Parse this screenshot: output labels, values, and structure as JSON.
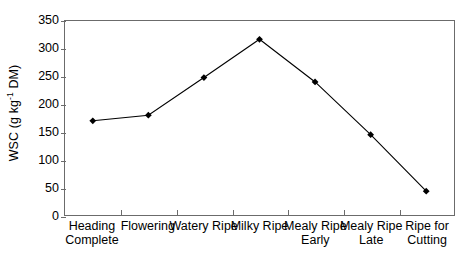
{
  "chart_data": {
    "type": "line",
    "title": "",
    "xlabel": "",
    "ylabel": "WSC (g kg⁻¹ DM)",
    "ylabel_parts": {
      "before": "WSC (g kg",
      "exponent": "-1",
      "after": " DM)"
    },
    "categories": [
      "Heading Complete",
      "Flowering",
      "Watery Ripe",
      "Milky Ripe",
      "Mealy Ripe Early",
      "Mealy Ripe Late",
      "Ripe for Cutting"
    ],
    "category_lines": [
      [
        "Heading",
        "Complete"
      ],
      [
        "Flowering"
      ],
      [
        "Watery Ripe"
      ],
      [
        "Milky Ripe"
      ],
      [
        "Mealy Ripe",
        "Early"
      ],
      [
        "Mealy Ripe",
        "Late"
      ],
      [
        "Ripe for",
        "Cutting"
      ]
    ],
    "values": [
      170,
      180,
      248,
      317,
      240,
      145,
      43
    ],
    "ylim": [
      0,
      350
    ],
    "yticks": [
      0,
      50,
      100,
      150,
      200,
      250,
      300,
      350
    ],
    "ytick_labels": [
      "0",
      "50",
      "100",
      "150",
      "200",
      "250",
      "300",
      "350"
    ],
    "grid": false,
    "legend": "none",
    "marker": "diamond",
    "marker_color": "#000000",
    "line_color": "#000000",
    "axis_color": "#6b6b6b",
    "background": "#ffffff"
  }
}
